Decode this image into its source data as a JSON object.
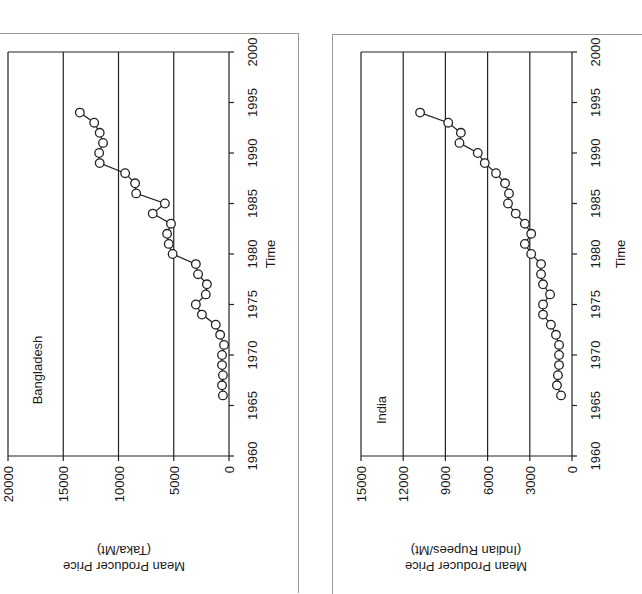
{
  "chart_data": [
    {
      "type": "line",
      "title": "Bangladesh",
      "xlabel": "Time",
      "ylabel": "Mean Producer Price (Taka/Mt)",
      "ylabel_line1": "Mean Producer Price",
      "ylabel_line2": "(Taka/Mt)",
      "xlim": [
        1960,
        2000
      ],
      "ylim": [
        0,
        20000
      ],
      "x_ticks": [
        "1960",
        "1965",
        "1970",
        "1975",
        "1980",
        "1985",
        "1990",
        "1995",
        "2000"
      ],
      "y_ticks": [
        "0",
        "5000",
        "10000",
        "15000",
        "20000"
      ],
      "grid": "horizontal-major",
      "marker": "open-circle",
      "series": [
        {
          "name": "Bangladesh",
          "x": [
            1966,
            1967,
            1968,
            1969,
            1970,
            1971,
            1972,
            1973,
            1974,
            1975,
            1976,
            1977,
            1978,
            1979,
            1980,
            1981,
            1982,
            1983,
            1984,
            1985,
            1986,
            1987,
            1988,
            1989,
            1990,
            1991,
            1992,
            1993,
            1994
          ],
          "values": [
            550,
            630,
            550,
            630,
            630,
            450,
            800,
            1200,
            2450,
            3000,
            2100,
            2000,
            2800,
            3000,
            5100,
            5450,
            5600,
            5250,
            6900,
            5800,
            8400,
            8500,
            9400,
            11700,
            11750,
            11400,
            11700,
            12200,
            13500
          ]
        }
      ]
    },
    {
      "type": "line",
      "title": "India",
      "xlabel": "Time",
      "ylabel": "Mean Producer Price (Indian Rupees/Mt)",
      "ylabel_line1": "Mean Producer Price",
      "ylabel_line2": "(Indian Rupees/Mt)",
      "xlim": [
        1960,
        2000
      ],
      "ylim": [
        0,
        15000
      ],
      "x_ticks": [
        "1960",
        "1965",
        "1970",
        "1975",
        "1980",
        "1985",
        "1990",
        "1995",
        "2000"
      ],
      "y_ticks": [
        "0",
        "3000",
        "6000",
        "9000",
        "12000",
        "15000"
      ],
      "grid": "horizontal-major",
      "marker": "open-circle",
      "series": [
        {
          "name": "India",
          "x": [
            1966,
            1967,
            1968,
            1969,
            1970,
            1971,
            1972,
            1973,
            1974,
            1975,
            1976,
            1977,
            1978,
            1979,
            1980,
            1981,
            1982,
            1983,
            1984,
            1985,
            1986,
            1987,
            1988,
            1989,
            1990,
            1991,
            1992,
            1993,
            1994
          ],
          "values": [
            780,
            1070,
            1000,
            920,
            920,
            920,
            1140,
            1500,
            2060,
            2060,
            1560,
            2060,
            2200,
            2200,
            2900,
            3350,
            2900,
            3350,
            4000,
            4550,
            4480,
            4760,
            5400,
            6200,
            6700,
            8000,
            7900,
            8800,
            10800
          ]
        }
      ]
    }
  ]
}
